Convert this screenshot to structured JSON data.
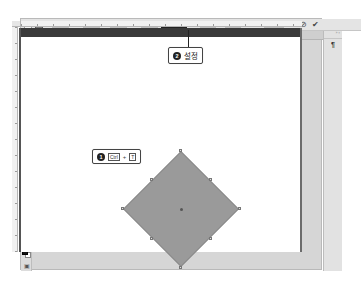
{
  "options_bar": {
    "reference_icon": "reference-point-icon",
    "x_label": "X:",
    "x_value": "450.50 px",
    "link_icon": "delta-icon",
    "y_label": "Y:",
    "y_value": "450.50 px",
    "w_label": "W:",
    "w_value": "283.48 px",
    "chain_icon": "link-icon",
    "h_label": "H:",
    "h_value": "283.48 px",
    "angle_icon": "angle-icon",
    "angle_value": "45",
    "angle_unit": "°",
    "hskew_label": "H:",
    "hskew_value": "0.00",
    "hskew_unit": "°",
    "vskew_label": "V:",
    "vskew_value": "0.00",
    "vskew_unit": "°",
    "interpolation_label": "Interpolation:",
    "interpolation_value": "Bicubic",
    "warp_icon": "warp-icon",
    "cancel_icon": "cancel-transform-icon",
    "commit_icon": "commit-transform-icon"
  },
  "document_tab": {
    "title": "review_solomeo.psd @ 50.1% (Rectangle 1, RGB/8) *",
    "close": "×"
  },
  "toolbox": {
    "tools": [
      {
        "name": "move-tool",
        "glyph": "✥"
      },
      {
        "name": "marquee-tool",
        "glyph": "⬚"
      },
      {
        "name": "lasso-tool",
        "glyph": "ℓ"
      },
      {
        "name": "quick-select-tool",
        "glyph": "⁄"
      },
      {
        "name": "crop-tool",
        "glyph": "⌗"
      },
      {
        "name": "eyedropper-tool",
        "glyph": "⁄"
      },
      {
        "name": "healing-brush-tool",
        "glyph": "◎"
      },
      {
        "name": "brush-tool",
        "glyph": "⁄"
      },
      {
        "name": "clone-stamp-tool",
        "glyph": "♙"
      },
      {
        "name": "history-brush-tool",
        "glyph": "↺"
      },
      {
        "name": "eraser-tool",
        "glyph": "◆"
      },
      {
        "name": "gradient-tool",
        "glyph": "▦"
      },
      {
        "name": "blur-tool",
        "glyph": "◌"
      },
      {
        "name": "dodge-tool",
        "glyph": "●"
      },
      {
        "name": "pen-tool",
        "glyph": "✒"
      },
      {
        "name": "type-tool",
        "glyph": "T"
      },
      {
        "name": "path-select-tool",
        "glyph": "↖"
      },
      {
        "name": "rectangle-tool",
        "glyph": "▭"
      },
      {
        "name": "hand-tool",
        "glyph": "✋"
      },
      {
        "name": "zoom-tool",
        "glyph": "⚲"
      },
      {
        "name": "more-tools",
        "glyph": "…"
      }
    ],
    "screen_mode_glyph": "▣"
  },
  "right_panel": {
    "collapse_label": "» ×",
    "paragraph_icon_glyph": "¶"
  },
  "callouts": {
    "step1": {
      "number": "1",
      "key1": "Ctrl",
      "plus": "+",
      "key2": "T"
    },
    "step2": {
      "number": "2",
      "text": "설정"
    }
  },
  "canvas": {
    "shape_color": "#9a9a9a",
    "pasteboard_top_color": "#3a3a3a"
  }
}
